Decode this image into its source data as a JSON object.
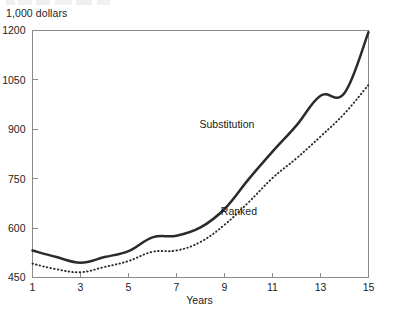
{
  "figure": {
    "unit_label": "1,000 dollars",
    "x_axis_title": "Years"
  },
  "chart_data": {
    "type": "line",
    "title": "",
    "subtitle": "",
    "xlabel": "Years",
    "ylabel": "1,000 dollars",
    "xlim": [
      1,
      15
    ],
    "ylim": [
      450,
      1200
    ],
    "grid": false,
    "legend_position": "inline-annotation",
    "y_ticks": [
      450,
      600,
      750,
      900,
      1050,
      1200
    ],
    "y_tick_labels": [
      "450",
      "600",
      "750",
      "900",
      "1050",
      "1200"
    ],
    "x_ticks": [
      1,
      3,
      5,
      7,
      9,
      11,
      13,
      15
    ],
    "x_tick_labels": [
      "1",
      "3",
      "5",
      "7",
      "9",
      "11",
      "13",
      "15"
    ],
    "x": [
      1,
      2,
      3,
      4,
      5,
      6,
      7,
      8,
      9,
      10,
      11,
      12,
      13,
      14,
      15
    ],
    "series": [
      {
        "name": "Substitution",
        "style": "solid-thick",
        "color": "#2b2b2b",
        "label_x": 9.1,
        "label_y": 905,
        "values": [
          532,
          512,
          495,
          512,
          530,
          572,
          577,
          602,
          658,
          748,
          832,
          912,
          1002,
          1010,
          1195
        ]
      },
      {
        "name": "Ranked",
        "style": "dotted",
        "color": "#2b2b2b",
        "label_x": 9.6,
        "label_y": 640,
        "values": [
          492,
          475,
          466,
          482,
          500,
          528,
          532,
          558,
          610,
          678,
          752,
          812,
          878,
          948,
          1035
        ]
      }
    ],
    "annotations": [
      {
        "text": "Substitution",
        "x": 9.1,
        "y": 905
      },
      {
        "text": "Ranked",
        "x": 9.6,
        "y": 640
      }
    ]
  }
}
